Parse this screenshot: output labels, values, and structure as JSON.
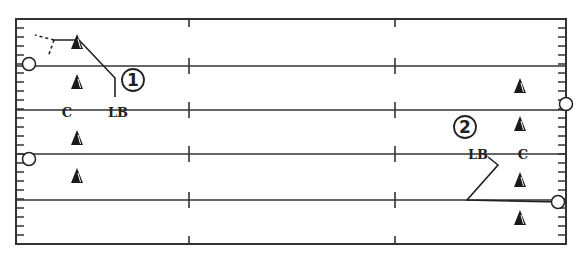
{
  "diagram": {
    "title": "",
    "field": {
      "left": 16,
      "top": 19,
      "right": 566,
      "bottom": 244,
      "yard_lines_y": [
        66,
        110,
        154,
        200
      ],
      "hash_x": [
        189,
        395
      ],
      "line_color": "#333333"
    },
    "players": [
      {
        "id": "d1",
        "type": "triangle",
        "x": 77,
        "y": 42
      },
      {
        "id": "d2",
        "type": "triangle",
        "x": 77,
        "y": 82
      },
      {
        "id": "d3",
        "type": "triangle",
        "x": 77,
        "y": 138
      },
      {
        "id": "d4",
        "type": "triangle",
        "x": 77,
        "y": 176
      },
      {
        "id": "d5",
        "type": "triangle",
        "x": 520,
        "y": 86
      },
      {
        "id": "d6",
        "type": "triangle",
        "x": 520,
        "y": 124
      },
      {
        "id": "d7",
        "type": "triangle",
        "x": 520,
        "y": 180
      },
      {
        "id": "d8",
        "type": "triangle",
        "x": 520,
        "y": 218
      },
      {
        "id": "o1",
        "type": "circle",
        "x": 29,
        "y": 64
      },
      {
        "id": "o2",
        "type": "circle",
        "x": 29,
        "y": 159
      },
      {
        "id": "o3",
        "type": "circle",
        "x": 566,
        "y": 104
      },
      {
        "id": "o4",
        "type": "circle",
        "x": 558,
        "y": 202
      }
    ],
    "labels": [
      {
        "id": "c1",
        "text": "C",
        "x": 67,
        "y": 117
      },
      {
        "id": "lb1",
        "text": "LB",
        "x": 118,
        "y": 117
      },
      {
        "id": "lb2",
        "text": "LB",
        "x": 478,
        "y": 159
      },
      {
        "id": "c2",
        "text": "C",
        "x": 523,
        "y": 159
      }
    ],
    "circled_numbers": [
      {
        "id": "n1",
        "text": "1",
        "x": 133,
        "y": 80
      },
      {
        "id": "n2",
        "text": "2",
        "x": 465,
        "y": 127
      }
    ],
    "routes": [
      {
        "id": "route-1",
        "points": "115,97 115,78 79,40 54,40"
      },
      {
        "id": "route-2",
        "points": "488,157 498,165 467,200 558,202"
      }
    ],
    "dashed_routes": [
      {
        "id": "dash-1a",
        "points": "54,40 35,35"
      },
      {
        "id": "dash-1b",
        "points": "54,40 48,57"
      }
    ]
  }
}
